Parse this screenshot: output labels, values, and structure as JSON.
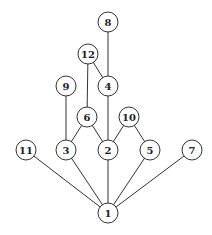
{
  "diagram": {
    "type": "hasse-diagram",
    "radius": 10,
    "nodes": [
      {
        "id": "1",
        "label": "1",
        "x": 108,
        "y": 213
      },
      {
        "id": "2",
        "label": "2",
        "x": 108,
        "y": 150
      },
      {
        "id": "3",
        "label": "3",
        "x": 66,
        "y": 150
      },
      {
        "id": "4",
        "label": "4",
        "x": 108,
        "y": 86
      },
      {
        "id": "5",
        "label": "5",
        "x": 150,
        "y": 150
      },
      {
        "id": "6",
        "label": "6",
        "x": 87,
        "y": 117
      },
      {
        "id": "7",
        "label": "7",
        "x": 192,
        "y": 150
      },
      {
        "id": "8",
        "label": "8",
        "x": 108,
        "y": 22
      },
      {
        "id": "9",
        "label": "9",
        "x": 66,
        "y": 86
      },
      {
        "id": "10",
        "label": "10",
        "x": 129,
        "y": 117
      },
      {
        "id": "11",
        "label": "11",
        "x": 26,
        "y": 150
      },
      {
        "id": "12",
        "label": "12",
        "x": 88,
        "y": 54
      }
    ],
    "edges": [
      [
        "8",
        "4"
      ],
      [
        "12",
        "4"
      ],
      [
        "12",
        "6"
      ],
      [
        "4",
        "2"
      ],
      [
        "9",
        "3"
      ],
      [
        "6",
        "3"
      ],
      [
        "6",
        "2"
      ],
      [
        "10",
        "2"
      ],
      [
        "10",
        "5"
      ],
      [
        "11",
        "1"
      ],
      [
        "3",
        "1"
      ],
      [
        "2",
        "1"
      ],
      [
        "5",
        "1"
      ],
      [
        "7",
        "1"
      ]
    ]
  }
}
